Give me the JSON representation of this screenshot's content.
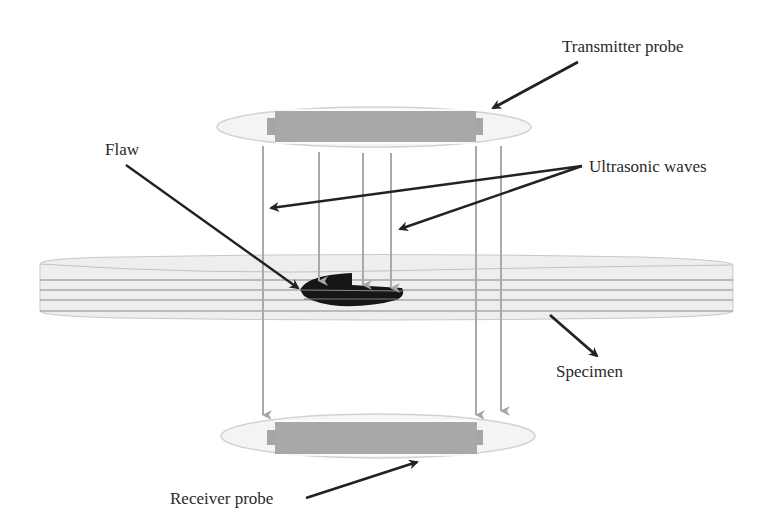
{
  "figure": {
    "labels": {
      "transmitter": "Transmitter probe",
      "flaw": "Flaw",
      "waves": "Ultrasonic waves",
      "specimen": "Specimen",
      "receiver": "Receiver probe"
    },
    "colors": {
      "probe_body": "#a8a8a8",
      "probe_housing": "#f3f3f3",
      "probe_outline": "#d4d4d4",
      "specimen_fill": "#eeeeee",
      "specimen_lines": "#a9a9a9",
      "wave_lines": "#aaaaaa",
      "flaw": "#161616",
      "leader_arrows": "#222222",
      "text": "#2a2a2a"
    },
    "components": [
      {
        "id": "transmitter-probe",
        "role": "emits ultrasonic waves",
        "position": "top"
      },
      {
        "id": "specimen",
        "role": "layered material under test",
        "position": "middle"
      },
      {
        "id": "flaw",
        "role": "internal defect blocking waves",
        "position": "inside specimen"
      },
      {
        "id": "receiver-probe",
        "role": "receives transmitted waves",
        "position": "bottom"
      }
    ],
    "wave_beams": [
      {
        "x": 263,
        "reaches": "receiver"
      },
      {
        "x": 319,
        "reaches": "flaw"
      },
      {
        "x": 363,
        "reaches": "flaw"
      },
      {
        "x": 391,
        "reaches": "flaw"
      },
      {
        "x": 476,
        "reaches": "receiver"
      },
      {
        "x": 501,
        "reaches": "receiver"
      }
    ]
  }
}
